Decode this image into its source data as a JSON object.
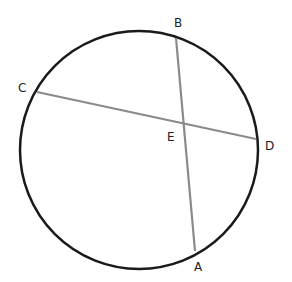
{
  "diagram": {
    "type": "circle-intersecting-chords",
    "circle": {
      "cx": 139,
      "cy": 150,
      "r": 119,
      "stroke": "#1a1a1a"
    },
    "chord_color": "#8a8a8a",
    "points": {
      "A": {
        "label": "A",
        "x": 195,
        "y": 251
      },
      "B": {
        "label": "B",
        "x": 176,
        "y": 38
      },
      "C": {
        "label": "C",
        "x": 37,
        "y": 92
      },
      "D": {
        "label": "D",
        "x": 256,
        "y": 139
      },
      "E": {
        "label": "E",
        "x": 184,
        "y": 123
      }
    },
    "chords": [
      {
        "from": "A",
        "to": "B"
      },
      {
        "from": "C",
        "to": "D"
      }
    ]
  }
}
